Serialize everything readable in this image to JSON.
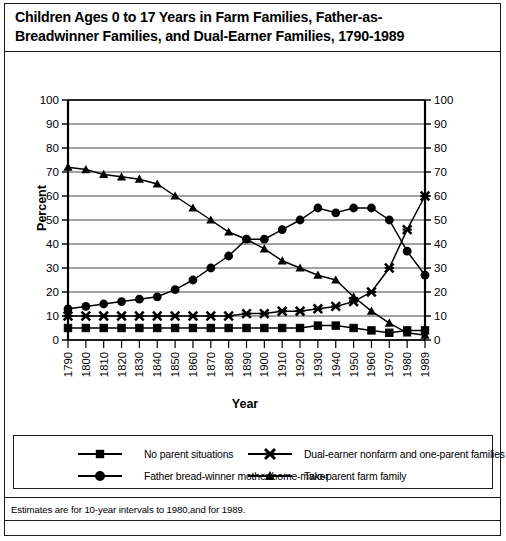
{
  "title": {
    "line1": "Children Ages 0 to 17 Years in Farm Families, Father-as-",
    "line2": "Breadwinner Families, and Dual-Earner Families, 1790-1989"
  },
  "footnote": "Estimates are for 10-year intervals to 1980,and for 1989.",
  "axis": {
    "ylabel": "Percent",
    "xlabel": "Year"
  },
  "legend": {
    "items": [
      {
        "label": "No parent situations",
        "marker": "square",
        "color": "#000000"
      },
      {
        "label": "Dual-earner nonfarm and one-parent families",
        "marker": "x",
        "color": "#000000"
      },
      {
        "label": "Father bread-winner mother home-maker",
        "marker": "circle",
        "color": "#000000"
      },
      {
        "label": "Two-parent farm family",
        "marker": "triangle",
        "color": "#000000"
      }
    ]
  },
  "chart_data": {
    "type": "line",
    "xlabel": "Year",
    "ylabel": "Percent",
    "grid": true,
    "legend_position": "bottom",
    "ylim": [
      0,
      100
    ],
    "ytick_labels": [
      "0",
      "10",
      "20",
      "30",
      "40",
      "50",
      "60",
      "70",
      "80",
      "90",
      "100"
    ],
    "yticks": [
      0,
      10,
      20,
      30,
      40,
      50,
      60,
      70,
      80,
      90,
      100
    ],
    "dual_y_axis": true,
    "categories": [
      "1790",
      "1800",
      "1810",
      "1820",
      "1830",
      "1840",
      "1850",
      "1860",
      "1870",
      "1880",
      "1890",
      "1900",
      "1910",
      "1920",
      "1930",
      "1940",
      "1950",
      "1960",
      "1970",
      "1980",
      "1989"
    ],
    "series": [
      {
        "name": "Two-parent farm family",
        "marker": "triangle",
        "color": "#000000",
        "values": [
          72,
          71,
          69,
          68,
          67,
          65,
          60,
          55,
          50,
          45,
          42,
          38,
          33,
          30,
          27,
          25,
          18,
          12,
          7,
          3,
          2
        ]
      },
      {
        "name": "Father bread-winner mother home-maker",
        "marker": "circle",
        "color": "#000000",
        "values": [
          13,
          14,
          15,
          16,
          17,
          18,
          21,
          25,
          30,
          35,
          42,
          42,
          46,
          50,
          55,
          53,
          55,
          55,
          50,
          37,
          27
        ]
      },
      {
        "name": "Dual-earner nonfarm and one-parent families",
        "marker": "x",
        "color": "#000000",
        "values": [
          10,
          10,
          10,
          10,
          10,
          10,
          10,
          10,
          10,
          10,
          11,
          11,
          12,
          12,
          13,
          14,
          16,
          20,
          30,
          46,
          60
        ]
      },
      {
        "name": "No parent situations",
        "marker": "square",
        "color": "#000000",
        "values": [
          5,
          5,
          5,
          5,
          5,
          5,
          5,
          5,
          5,
          5,
          5,
          5,
          5,
          5,
          6,
          6,
          5,
          4,
          3,
          4,
          4
        ]
      }
    ]
  }
}
